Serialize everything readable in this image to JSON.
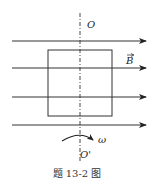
{
  "diagram": {
    "caption": "题 13-2 图",
    "labels": {
      "axis_top": "O",
      "axis_bottom": "O'",
      "field": "B",
      "angular_velocity": "ω"
    },
    "elements": {
      "field_lines": 4,
      "field_direction": "right",
      "coil": "rectangular loop",
      "rotation_axis": "vertical dashed line OO'"
    },
    "colors": {
      "line": "#333333",
      "background": "#ffffff"
    }
  }
}
